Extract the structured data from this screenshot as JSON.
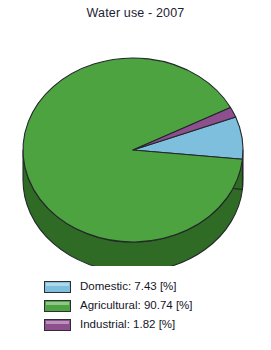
{
  "chart": {
    "title": "Water use - 2007"
  },
  "chart_data": {
    "type": "pie",
    "title": "Water use - 2007",
    "three_d": true,
    "unit": "[%]",
    "categories": [
      "Domestic",
      "Agricultural",
      "Industrial"
    ],
    "values": [
      7.43,
      90.74,
      1.82
    ],
    "colors": [
      "#7ebfdd",
      "#4da33f",
      "#8e4f8f"
    ],
    "side_colors": [
      "#3f6b7e",
      "#2f6b24",
      "#5c2f5e"
    ],
    "legend_position": "bottom",
    "legend_entries": [
      {
        "label": "Domestic: 7.43 [%]",
        "name": "Domestic",
        "value": 7.43,
        "color": "#7ebfdd"
      },
      {
        "label": "Agricultural: 90.74 [%]",
        "name": "Agricultural",
        "value": 90.74,
        "color": "#4da33f"
      },
      {
        "label": "Industrial: 1.82 [%]",
        "name": "Industrial",
        "value": 1.82,
        "color": "#8e4f8f"
      }
    ],
    "grid": false,
    "xlabel": "",
    "ylabel": ""
  },
  "legend": {
    "items": [
      {
        "label": "Domestic: 7.43 [%]",
        "color": "#7ebfdd"
      },
      {
        "label": "Agricultural: 90.74 [%]",
        "color": "#4da33f"
      },
      {
        "label": "Industrial: 1.82 [%]",
        "color": "#8e4f8f"
      }
    ]
  }
}
